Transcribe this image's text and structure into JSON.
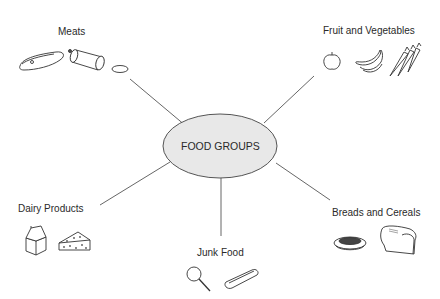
{
  "diagram": {
    "center": {
      "label": "FOOD GROUPS",
      "fill": "#e8e8e8"
    },
    "nodes": [
      {
        "id": "meats",
        "label": "Meats",
        "icons": [
          "steak-icon",
          "sausage-roll-icon",
          "meat-slice-icon"
        ]
      },
      {
        "id": "fruit-veg",
        "label": "Fruit and Vegetables",
        "icons": [
          "apple-icon",
          "banana-icon",
          "carrot-icon"
        ]
      },
      {
        "id": "dairy",
        "label": "Dairy Products",
        "icons": [
          "milk-carton-icon",
          "cheese-icon"
        ]
      },
      {
        "id": "breads",
        "label": "Breads and Cereals",
        "icons": [
          "cereal-bowl-icon",
          "bread-loaf-icon"
        ]
      },
      {
        "id": "junk",
        "label": "Junk Food",
        "icons": [
          "lollipop-icon",
          "hot-dog-icon"
        ]
      }
    ]
  }
}
